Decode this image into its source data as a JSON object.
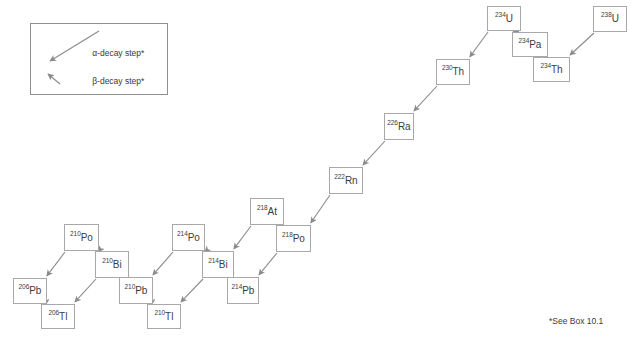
{
  "diagram": {
    "background_color": "#ffffff",
    "box_border_color": "#a8a8a8",
    "arrow_color": "#8a8a8a",
    "text_color": "#3c3c3c"
  },
  "legend": {
    "box": {
      "x": 30,
      "y": 23,
      "width": 138,
      "height": 72
    },
    "items": [
      {
        "id": "alpha",
        "label": "α-decay step*",
        "arrow": "long-diagonal-down-left"
      },
      {
        "id": "beta",
        "label": "β-decay step*",
        "arrow": "short-diagonal-up-left"
      }
    ]
  },
  "footnote": {
    "text": "*See Box 10.1",
    "x": 549,
    "y": 316
  },
  "nuclides": [
    {
      "id": "u238",
      "mass": "238",
      "symbol": "U",
      "x": 593,
      "y": 6,
      "w": 34,
      "h": 26
    },
    {
      "id": "th234",
      "mass": "234",
      "symbol": "Th",
      "x": 533,
      "y": 57,
      "w": 37,
      "h": 25
    },
    {
      "id": "pa234",
      "mass": "234",
      "symbol": "Pa",
      "x": 512,
      "y": 32,
      "w": 36,
      "h": 25
    },
    {
      "id": "u234",
      "mass": "234",
      "symbol": "U",
      "x": 487,
      "y": 6,
      "w": 34,
      "h": 25
    },
    {
      "id": "th230",
      "mass": "230",
      "symbol": "Th",
      "x": 436,
      "y": 59,
      "w": 34,
      "h": 26
    },
    {
      "id": "ra226",
      "mass": "226",
      "symbol": "Ra",
      "x": 384,
      "y": 113,
      "w": 30,
      "h": 27
    },
    {
      "id": "rn222",
      "mass": "222",
      "symbol": "Rn",
      "x": 329,
      "y": 167,
      "w": 34,
      "h": 27
    },
    {
      "id": "at218",
      "mass": "218",
      "symbol": "At",
      "x": 250,
      "y": 198,
      "w": 34,
      "h": 27
    },
    {
      "id": "po218",
      "mass": "218",
      "symbol": "Po",
      "x": 276,
      "y": 225,
      "w": 35,
      "h": 27
    },
    {
      "id": "pb214",
      "mass": "214",
      "symbol": "Pb",
      "x": 227,
      "y": 277,
      "w": 32,
      "h": 27
    },
    {
      "id": "bi214",
      "mass": "214",
      "symbol": "Bi",
      "x": 202,
      "y": 251,
      "w": 32,
      "h": 27
    },
    {
      "id": "po214",
      "mass": "214",
      "symbol": "Po",
      "x": 172,
      "y": 224,
      "w": 33,
      "h": 27
    },
    {
      "id": "tl210",
      "mass": "210",
      "symbol": "Tl",
      "x": 147,
      "y": 304,
      "w": 34,
      "h": 25
    },
    {
      "id": "pb210",
      "mass": "210",
      "symbol": "Pb",
      "x": 119,
      "y": 277,
      "w": 34,
      "h": 27
    },
    {
      "id": "bi210",
      "mass": "210",
      "symbol": "Bi",
      "x": 95,
      "y": 251,
      "w": 34,
      "h": 27
    },
    {
      "id": "po210",
      "mass": "210",
      "symbol": "Po",
      "x": 64,
      "y": 224,
      "w": 35,
      "h": 27
    },
    {
      "id": "tl206",
      "mass": "206",
      "symbol": "Tl",
      "x": 41,
      "y": 304,
      "w": 34,
      "h": 25
    },
    {
      "id": "pb206",
      "mass": "206",
      "symbol": "Pb",
      "x": 13,
      "y": 278,
      "w": 34,
      "h": 26
    }
  ],
  "decay_steps": [
    {
      "from": "u238",
      "to": "th234",
      "type": "alpha"
    },
    {
      "from": "th234",
      "to": "pa234",
      "type": "beta"
    },
    {
      "from": "pa234",
      "to": "u234",
      "type": "beta"
    },
    {
      "from": "u234",
      "to": "th230",
      "type": "alpha"
    },
    {
      "from": "th230",
      "to": "ra226",
      "type": "alpha"
    },
    {
      "from": "ra226",
      "to": "rn222",
      "type": "alpha"
    },
    {
      "from": "rn222",
      "to": "po218",
      "type": "alpha"
    },
    {
      "from": "po218",
      "to": "at218",
      "type": "beta"
    },
    {
      "from": "po218",
      "to": "pb214",
      "type": "alpha"
    },
    {
      "from": "at218",
      "to": "bi214",
      "type": "alpha"
    },
    {
      "from": "pb214",
      "to": "bi214",
      "type": "beta"
    },
    {
      "from": "bi214",
      "to": "po214",
      "type": "beta"
    },
    {
      "from": "bi214",
      "to": "tl210",
      "type": "alpha"
    },
    {
      "from": "po214",
      "to": "pb210",
      "type": "alpha"
    },
    {
      "from": "tl210",
      "to": "pb210",
      "type": "beta"
    },
    {
      "from": "pb210",
      "to": "bi210",
      "type": "beta"
    },
    {
      "from": "bi210",
      "to": "po210",
      "type": "beta"
    },
    {
      "from": "bi210",
      "to": "tl206",
      "type": "alpha"
    },
    {
      "from": "po210",
      "to": "pb206",
      "type": "alpha"
    },
    {
      "from": "tl206",
      "to": "pb206",
      "type": "beta"
    }
  ]
}
